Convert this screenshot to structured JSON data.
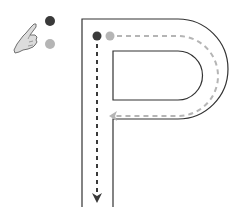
{
  "diagram": {
    "letter": "P",
    "legend": {
      "pointer": "hand-pointer-icon",
      "stroke_1_color": "#3a3a3a",
      "stroke_2_color": "#b5b5b5"
    },
    "strokes": [
      {
        "order": 1,
        "color": "#3a3a3a",
        "direction": "down",
        "style": "dashed",
        "path": "vertical stem"
      },
      {
        "order": 2,
        "color": "#b5b5b5",
        "direction": "right-around-left",
        "style": "dashed",
        "path": "bowl"
      }
    ],
    "colors": {
      "outline": "#333333",
      "stroke_dark": "#3a3a3a",
      "stroke_light": "#b5b5b5",
      "hand_fill": "#d9d9d9",
      "hand_outline": "#6e6e6e"
    }
  }
}
